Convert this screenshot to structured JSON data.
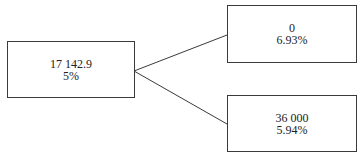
{
  "diagram": {
    "type": "tree",
    "nodes": [
      {
        "id": "root",
        "value": "17 142.9",
        "percent": "5%"
      },
      {
        "id": "upper",
        "value": "0",
        "percent": "6.93%"
      },
      {
        "id": "lower",
        "value": "36 000",
        "percent": "5.94%"
      }
    ],
    "edges": [
      {
        "from": "root",
        "to": "upper"
      },
      {
        "from": "root",
        "to": "lower"
      }
    ],
    "colors": {
      "line": "#3a3a3a",
      "background": "#ffffff",
      "text": "#222222"
    }
  }
}
